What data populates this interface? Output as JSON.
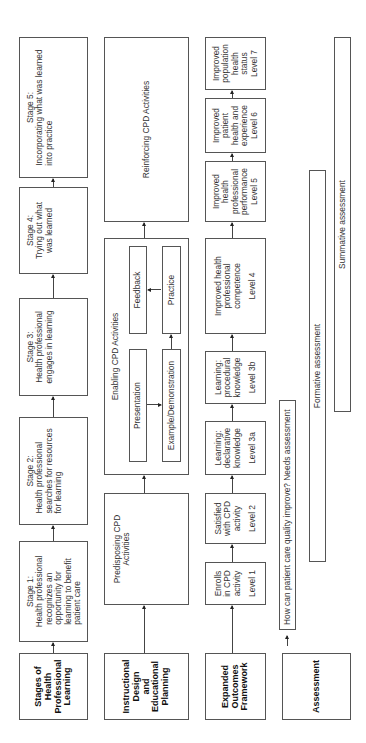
{
  "rows": {
    "stages": {
      "header": "Stages of Health Professional Learning",
      "header_lines": [
        "Stages of",
        "Health",
        "Professional",
        "Learning"
      ],
      "items": [
        {
          "title": "Stage 1:",
          "lines": [
            "Health professional",
            "recognizes an",
            "opportunity for",
            "learning to benefit",
            "patient care"
          ]
        },
        {
          "title": "Stage 2:",
          "lines": [
            "Health professional",
            "searches for resources",
            "for learning"
          ]
        },
        {
          "title": "Stage 3:",
          "lines": [
            "Health professional",
            "engages in learning"
          ]
        },
        {
          "title": "Stage 4:",
          "lines": [
            "Trying out what",
            "was learned"
          ]
        },
        {
          "title": "Stage 5:",
          "lines": [
            "Incorporating what was learned",
            "into practice"
          ]
        }
      ]
    },
    "instructional": {
      "header": "Instructional Design and Educational Planning",
      "header_lines": [
        "Instructional",
        "Design",
        "and",
        "Educational",
        "Planning"
      ],
      "predisposing": [
        "Predisposing CPD",
        "Activities"
      ],
      "enabling": {
        "title": "Enabling CPD Activities",
        "presentation": "Presentation",
        "example": "Example/Demonstration",
        "practice": "Practice",
        "feedback": "Feedback"
      },
      "reinforcing": "Reinforcing CPD Activities"
    },
    "outcomes": {
      "header": "Expanded Outcomes Framework",
      "header_lines": [
        "Expanded",
        "Outcomes",
        "Framework"
      ],
      "levels": [
        {
          "lines": [
            "Enrolls",
            "in CPD",
            "activity"
          ],
          "level": "Level 1"
        },
        {
          "lines": [
            "Satisfied",
            "with CPD",
            "activity"
          ],
          "level": "Level 2"
        },
        {
          "lines": [
            "Learning:",
            "declarative",
            "knowledge"
          ],
          "level": "Level 3a"
        },
        {
          "lines": [
            "Learning:",
            "procedural",
            "knowledge"
          ],
          "level": "Level 3b"
        },
        {
          "lines": [
            "Improved health",
            "professional",
            "competence"
          ],
          "level": "Level 4"
        },
        {
          "lines": [
            "Improved",
            "health",
            "professional",
            "performance"
          ],
          "level": "Level 5"
        },
        {
          "lines": [
            "Improved",
            "patient",
            "health and",
            "experience"
          ],
          "level": "Level 6"
        },
        {
          "lines": [
            "Improved",
            "population",
            "health",
            "status"
          ],
          "level": "Level 7"
        }
      ]
    },
    "assessment": {
      "header": "Assessment",
      "needs": "How can patient care quality improve? Needs assessment",
      "formative": "Formative assessment",
      "summative": "Summative assessment"
    }
  },
  "colors": {
    "border": "#555555",
    "text": "#333333",
    "header_text": "#111111",
    "background": "#ffffff"
  }
}
